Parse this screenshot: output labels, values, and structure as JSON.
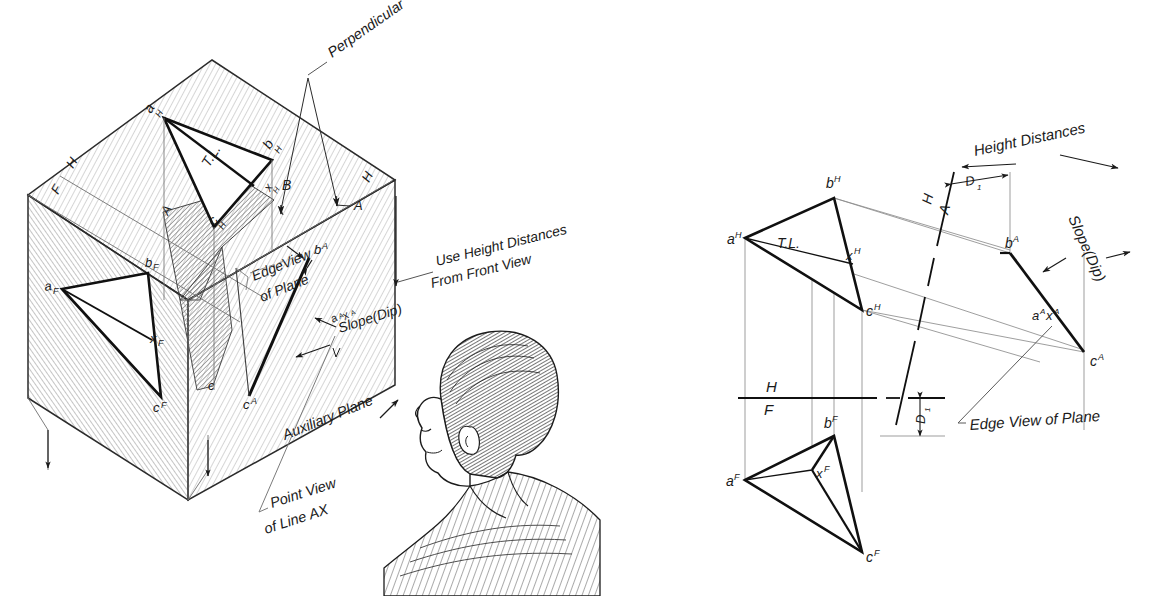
{
  "figure": {
    "ink_color": "#1a1a1a",
    "paper_color": "#ffffff",
    "shade_color": "#b9b9b9",
    "pencil_color": "#9a9a9a"
  },
  "pictorial": {
    "name": "Pictorial glass-box view",
    "cube_labels": {
      "fold_h_top_left": "H",
      "fold_f_left": "F",
      "fold_a_left": "A",
      "fold_h_right": "H",
      "fold_a_right": "A"
    },
    "top_view": {
      "a": "a",
      "a_sup": "H",
      "b": "b",
      "b_sup": "H",
      "c": "c",
      "c_sup": "H",
      "tl": "T.L.",
      "x_mark": "x",
      "x_sup": "H",
      "b_mark": "B"
    },
    "front_view": {
      "a": "a",
      "a_sup": "F",
      "b": "b",
      "b_sup": "F",
      "c": "c",
      "c_sup": "F",
      "x": "x",
      "x_sup": "F"
    },
    "aux_view": {
      "b": "b",
      "b_sup": "A",
      "c": "c",
      "c_sup": "A",
      "ax": "a",
      "ax_sup1": "A",
      "ax_x": "x",
      "ax_sup2": "A",
      "c_plain": "c"
    },
    "annotations": [
      {
        "id": "perpendicular",
        "text": "Perpendicular"
      },
      {
        "id": "use-height-distances",
        "line1": "Use Height Distances",
        "line2": "From Front View"
      },
      {
        "id": "edge-view-of-plane",
        "line1": "EdgeView",
        "line2": "of Plane"
      },
      {
        "id": "slope-dip",
        "text": "Slope(Dip)"
      },
      {
        "id": "auxiliary-plane",
        "text": "Auxiliary Plane"
      },
      {
        "id": "point-view-of-line-ax",
        "line1": "Point View",
        "line2": "of Line AX"
      }
    ]
  },
  "orthographic": {
    "name": "Orthographic multiview layout",
    "top_view": {
      "a": "a",
      "a_sup": "H",
      "b": "b",
      "b_sup": "H",
      "c": "c",
      "c_sup": "H",
      "x": "x",
      "x_sup": "H",
      "tl": "T.L."
    },
    "front_view": {
      "a": "a",
      "a_sup": "F",
      "b": "b",
      "b_sup": "F",
      "c": "c",
      "c_sup": "F",
      "x": "x",
      "x_sup": "F"
    },
    "aux_view": {
      "b": "b",
      "b_sup": "A",
      "c": "c",
      "c_sup": "A",
      "a": "a",
      "a_sup": "A",
      "x": "x",
      "x_sup": "A"
    },
    "fold_lines": {
      "hf_h": "H",
      "hf_f": "F",
      "ha_h": "H",
      "ha_a": "A"
    },
    "dimensions": {
      "d1_top": "D",
      "d1_top_sub": "1",
      "d1_bottom": "D",
      "d1_bottom_sub": "1"
    },
    "annotations": [
      {
        "id": "height-distances",
        "text": "Height Distances"
      },
      {
        "id": "slope-dip",
        "text": "Slope(Dip)"
      },
      {
        "id": "edge-view-of-plane",
        "text": "Edge View of Plane"
      }
    ]
  },
  "observer": {
    "name": "observer-head",
    "description": "Side profile of a person looking at the auxiliary plane"
  }
}
